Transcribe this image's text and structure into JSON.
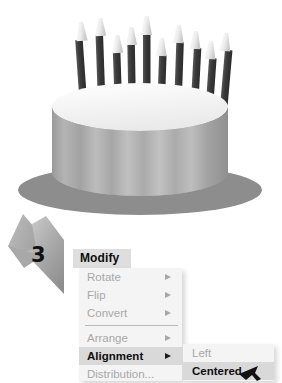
{
  "illustration": {
    "name": "birthday-cake",
    "candle_count": 10,
    "cake_body_color": "#a9a9a9",
    "cake_top_color": "#fbfbfb",
    "candle_stem_color": "#3d3d3d",
    "candle_flame_color": "#e8e8e8",
    "shadow_color": "#8b8b8b"
  },
  "step": {
    "number": "3",
    "arrow_color": "#a3a3a3"
  },
  "menu": {
    "title": "Modify",
    "items": [
      {
        "label": "Rotate",
        "has_submenu": true,
        "highlighted": false,
        "separator_after": false
      },
      {
        "label": "Flip",
        "has_submenu": true,
        "highlighted": false,
        "separator_after": false
      },
      {
        "label": "Convert",
        "has_submenu": true,
        "highlighted": false,
        "separator_after": true
      },
      {
        "label": "Arrange",
        "has_submenu": true,
        "highlighted": false,
        "separator_after": false
      },
      {
        "label": "Alignment",
        "has_submenu": true,
        "highlighted": true,
        "separator_after": false
      },
      {
        "label": "Distribution...",
        "has_submenu": false,
        "highlighted": false,
        "separator_after": false
      }
    ]
  },
  "submenu": {
    "items": [
      {
        "label": "Left",
        "highlighted": false
      },
      {
        "label": "Centered",
        "highlighted": true
      }
    ]
  },
  "cursor": {
    "icon": "mouse-pointer-icon",
    "color": "#111111"
  },
  "colors": {
    "menu_background": "#f4f4f4",
    "menu_title_background": "#dedede",
    "highlight_background": "#d9d9d9",
    "disabled_text": "#a8a8a8",
    "active_text": "#0f0f0f",
    "separator": "#b9b9b9",
    "page_background": "#ffffff"
  }
}
